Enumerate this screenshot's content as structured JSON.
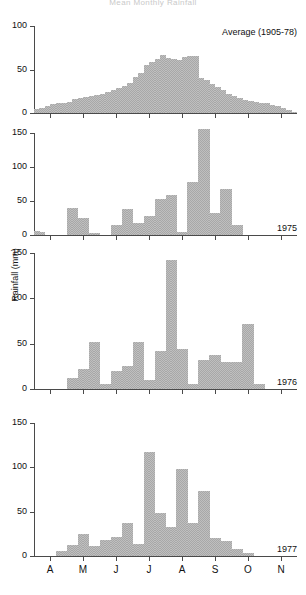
{
  "figure": {
    "title": "Mean Monthly Rainfall",
    "ylabel": "Rainfall (mm)"
  },
  "chart_data": {
    "type": "bar",
    "title": "Mean Monthly Rainfall",
    "xlabel": "",
    "ylabel": "Rainfall (mm)",
    "grid": false,
    "legend_position": "panel-top-right",
    "x_tick_labels": [
      "A",
      "M",
      "J",
      "J",
      "A",
      "S",
      "O",
      "N"
    ],
    "x_tick_months": [
      "April",
      "May",
      "June",
      "July",
      "August",
      "September",
      "October",
      "November"
    ],
    "bin_description": "pentad (5-day) bins across April to November",
    "n_bins": 48,
    "panels": [
      {
        "name": "average",
        "label": "Average (1905-78)",
        "label_position": "top-right",
        "ylim": [
          0,
          100
        ],
        "yticks": [
          0,
          50,
          100
        ],
        "values": [
          5,
          6,
          8,
          10,
          11,
          12,
          13,
          16,
          17,
          18,
          20,
          21,
          22,
          24,
          27,
          29,
          31,
          34,
          41,
          46,
          55,
          59,
          62,
          67,
          63,
          62,
          61,
          64,
          66,
          65,
          40,
          38,
          33,
          30,
          26,
          22,
          20,
          17,
          15,
          14,
          13,
          12,
          11,
          9,
          8,
          6,
          3,
          1
        ]
      },
      {
        "name": "y1975",
        "label": "1975",
        "label_position": "bottom-right",
        "ylim": [
          0,
          150
        ],
        "yticks": [
          0,
          50,
          100,
          150
        ],
        "values": [
          6,
          5,
          0,
          0,
          0,
          0,
          40,
          40,
          25,
          25,
          3,
          3,
          0,
          0,
          15,
          15,
          38,
          38,
          18,
          18,
          28,
          28,
          53,
          53,
          59,
          59,
          5,
          5,
          78,
          78,
          156,
          156,
          33,
          33,
          67,
          67,
          15,
          15,
          0,
          0,
          0,
          0,
          0,
          0,
          0,
          0,
          0,
          0
        ]
      },
      {
        "name": "y1976",
        "label": "1976",
        "label_position": "bottom-right",
        "ylim": [
          0,
          150
        ],
        "yticks": [
          0,
          50,
          100,
          150
        ],
        "values": [
          0,
          0,
          0,
          0,
          0,
          0,
          12,
          12,
          22,
          22,
          52,
          52,
          5,
          5,
          20,
          20,
          25,
          25,
          52,
          52,
          10,
          10,
          42,
          42,
          142,
          142,
          44,
          44,
          6,
          6,
          32,
          32,
          38,
          38,
          30,
          30,
          30,
          30,
          72,
          72,
          5,
          5,
          0,
          0,
          0,
          0,
          0,
          0
        ]
      },
      {
        "name": "y1977",
        "label": "1977",
        "label_position": "bottom-right",
        "ylim": [
          0,
          150
        ],
        "yticks": [
          0,
          50,
          100,
          150
        ],
        "values": [
          0,
          0,
          0,
          0,
          6,
          6,
          12,
          12,
          25,
          25,
          11,
          11,
          18,
          18,
          22,
          22,
          37,
          37,
          14,
          14,
          117,
          117,
          49,
          49,
          33,
          33,
          98,
          98,
          37,
          37,
          73,
          73,
          20,
          20,
          17,
          17,
          8,
          8,
          3,
          3,
          0,
          0,
          0,
          0,
          0,
          0,
          0,
          0
        ]
      }
    ]
  },
  "colors": {
    "bar_fill": "#bfbfbf",
    "bar_dither": "#a8a8a8",
    "axis": "#4a4a4a",
    "text": "#111111"
  }
}
